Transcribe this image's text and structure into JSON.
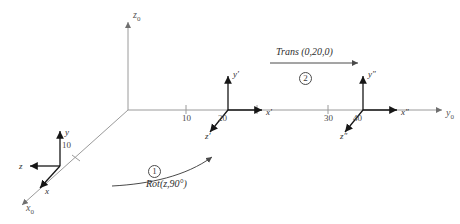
{
  "figure": {
    "type": "coordinate-frame-transformation-diagram",
    "background_color": "#ffffff",
    "line_color": "#8c8c8c",
    "frame_color": "#1f1f1f",
    "text_color": "#3a3a3a"
  },
  "world_axes": {
    "vertical": {
      "label": "z",
      "subscript": "0",
      "name": "z0-axis"
    },
    "horizontal": {
      "label": "y",
      "subscript": "0",
      "name": "y0-axis"
    },
    "diagonal": {
      "label": "x",
      "subscript": "0",
      "name": "x0-axis"
    }
  },
  "ticks": [
    {
      "value": "10",
      "axis": "x0"
    },
    {
      "value": "10",
      "axis": "y0"
    },
    {
      "value": "20",
      "axis": "y0"
    },
    {
      "value": "30",
      "axis": "y0"
    },
    {
      "value": "40",
      "axis": "y0"
    }
  ],
  "frames": [
    {
      "name": "frame-0",
      "position_label": "",
      "axes": [
        {
          "label": "y",
          "prime": ""
        },
        {
          "label": "z",
          "prime": ""
        },
        {
          "label": "x",
          "prime": ""
        }
      ]
    },
    {
      "name": "frame-1",
      "position_label": "20",
      "axes": [
        {
          "label": "y",
          "prime": "′"
        },
        {
          "label": "x",
          "prime": "′"
        },
        {
          "label": "z",
          "prime": "′"
        }
      ]
    },
    {
      "name": "frame-2",
      "position_label": "40",
      "axes": [
        {
          "label": "y",
          "prime": "″"
        },
        {
          "label": "x",
          "prime": "″"
        },
        {
          "label": "z",
          "prime": "″"
        }
      ]
    }
  ],
  "operations": [
    {
      "name": "rotation-operation",
      "step": "1",
      "text": "Rot(z,90°)",
      "arrow": "curved-arrow-up-right"
    },
    {
      "name": "translation-operation",
      "step": "2",
      "text": "Trans (0,20,0)",
      "arrow": "straight-arrow-right"
    }
  ]
}
